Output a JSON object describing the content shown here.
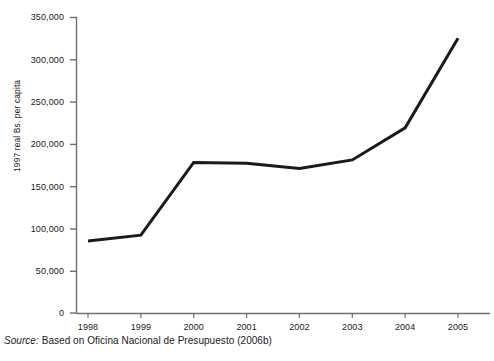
{
  "chart_data": {
    "type": "line",
    "title": "",
    "xlabel": "",
    "ylabel": "1997 real Bs. per capita",
    "categories": [
      "1998",
      "1999",
      "2000",
      "2001",
      "2002",
      "2003",
      "2004",
      "2005"
    ],
    "x": [
      1998,
      1999,
      2000,
      2001,
      2002,
      2003,
      2004,
      2005
    ],
    "values": [
      85000,
      92000,
      178000,
      177000,
      171000,
      181000,
      219000,
      325000
    ],
    "series": [
      {
        "name": "1997 real Bs. per capita",
        "values": [
          85000,
          92000,
          178000,
          177000,
          171000,
          181000,
          219000,
          325000
        ],
        "color": "#1a1a1a"
      }
    ],
    "ylim": [
      0,
      350000
    ],
    "yticks": [
      0,
      50000,
      100000,
      150000,
      200000,
      250000,
      300000,
      350000
    ],
    "ytick_labels": [
      "0",
      "50,000",
      "100,000",
      "150,000",
      "200,000",
      "250,000",
      "300,000",
      "350,000"
    ],
    "xtick_labels": [
      "1998",
      "1999",
      "2000",
      "2001",
      "2002",
      "2003",
      "2004",
      "2005"
    ],
    "grid": false,
    "legend": false,
    "legend_position": "none",
    "line_color": "#1a1a1a",
    "line_width": 3,
    "markers": false,
    "axis_color": "#6f6f6f"
  },
  "source": {
    "label": "Source:",
    "text": " Based on Oficina Nacional de Presupuesto (2006b)"
  }
}
